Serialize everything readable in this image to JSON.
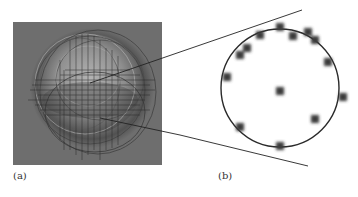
{
  "figure": {
    "panels": [
      {
        "id": "a",
        "label": "(a)",
        "description": "Grayscale rendered sphere with overlaid wireframe grid lines and elliptical contours on gray background"
      },
      {
        "id": "b",
        "label": "(b)",
        "description": "Magnified circle with blurred point markers along and inside the circle"
      }
    ],
    "colors": {
      "panel_a_background": "#6e6e6e",
      "sphere_light": "#a8a8a8",
      "sphere_shadow": "#3c3c3c",
      "line": "#2a2a2a",
      "dot": "#3a3a3a"
    },
    "panel_b": {
      "circle": {
        "cx": 280,
        "cy": 88,
        "r": 59
      },
      "dots": [
        {
          "x": 280,
          "y": 27
        },
        {
          "x": 260,
          "y": 35
        },
        {
          "x": 293,
          "y": 36
        },
        {
          "x": 308,
          "y": 32
        },
        {
          "x": 315,
          "y": 40
        },
        {
          "x": 247,
          "y": 48
        },
        {
          "x": 240,
          "y": 55
        },
        {
          "x": 328,
          "y": 62
        },
        {
          "x": 227,
          "y": 77
        },
        {
          "x": 280,
          "y": 91
        },
        {
          "x": 343,
          "y": 97
        },
        {
          "x": 315,
          "y": 119
        },
        {
          "x": 240,
          "y": 127
        },
        {
          "x": 280,
          "y": 146
        }
      ]
    }
  }
}
